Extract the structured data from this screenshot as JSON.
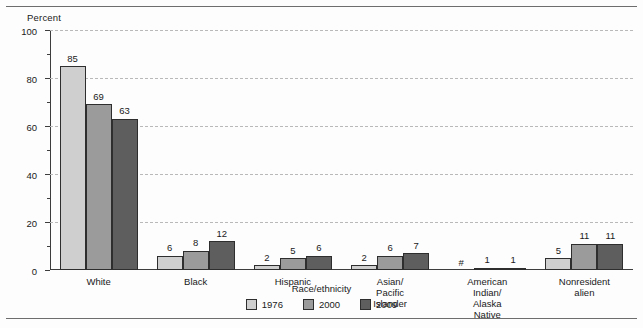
{
  "chart_data": {
    "type": "bar",
    "title": "",
    "xlabel": "Race/ethnicity",
    "ylabel": "Percent",
    "ylim": [
      0,
      100
    ],
    "ytick_labels": [
      "0",
      "20",
      "40",
      "60",
      "80",
      "100"
    ],
    "ytick_values": [
      0,
      20,
      40,
      60,
      80,
      100
    ],
    "yminor_values": [
      10,
      30,
      50,
      70,
      90
    ],
    "grid": "horizontal-dashed",
    "legend_position": "bottom-center",
    "categories": [
      "White",
      "Black",
      "Hispanic",
      "Asian/\nPacific Islander",
      "American Indian/\nAlaska Native",
      "Nonresident alien"
    ],
    "series": [
      {
        "name": "1976",
        "color": "#cfcfcf",
        "values": [
          85,
          6,
          2,
          2,
          0,
          5
        ],
        "labels": [
          "85",
          "6",
          "2",
          "2",
          "#",
          "5"
        ]
      },
      {
        "name": "2000",
        "color": "#9b9b9b",
        "values": [
          69,
          8,
          5,
          6,
          1,
          11
        ],
        "labels": [
          "69",
          "8",
          "5",
          "6",
          "1",
          "11"
        ]
      },
      {
        "name": "2009",
        "color": "#5e5e5e",
        "values": [
          63,
          12,
          6,
          7,
          1,
          11
        ],
        "labels": [
          "63",
          "12",
          "6",
          "7",
          "1",
          "11"
        ]
      }
    ]
  }
}
